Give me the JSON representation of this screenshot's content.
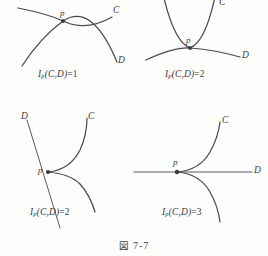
{
  "figure": {
    "caption": "図 7-7",
    "background_color": "#fdfdfb",
    "curve_color": "#4a4a52"
  },
  "panels": [
    {
      "id": "transverse-intersection",
      "position": "top-left",
      "point_label": "p",
      "curve_c_label": "C",
      "curve_d_label": "D",
      "formula_prefix": "I",
      "formula_subscript": "p",
      "formula_args": "(C,D)",
      "formula_equals": "=",
      "formula_value": "1"
    },
    {
      "id": "tangential-intersection",
      "position": "top-right",
      "point_label": "p",
      "curve_c_label": "C",
      "curve_d_label": "D",
      "formula_prefix": "I",
      "formula_subscript": "p",
      "formula_args": "(C,D)",
      "formula_equals": "=",
      "formula_value": "2"
    },
    {
      "id": "cusp-transverse-line",
      "position": "bottom-left",
      "point_label": "p",
      "curve_c_label": "C",
      "curve_d_label": "D",
      "formula_prefix": "I",
      "formula_subscript": "p",
      "formula_args": "(C,D)",
      "formula_equals": "=",
      "formula_value": "2"
    },
    {
      "id": "cusp-tangent-line",
      "position": "bottom-right",
      "point_label": "p",
      "curve_c_label": "C",
      "curve_d_label": "D",
      "formula_prefix": "I",
      "formula_subscript": "p",
      "formula_args": "(C,D)",
      "formula_equals": "=",
      "formula_value": "3"
    }
  ]
}
